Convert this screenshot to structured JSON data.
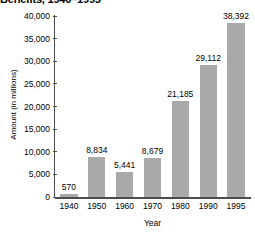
{
  "chart_data": {
    "type": "bar",
    "title": "Benefits, 1940–1995",
    "xlabel": "Year",
    "ylabel": "Amount (in millions)",
    "categories": [
      "1940",
      "1950",
      "1960",
      "1970",
      "1980",
      "1990",
      "1995"
    ],
    "values": [
      570,
      8834,
      5441,
      8679,
      21185,
      29112,
      38392
    ],
    "value_labels": [
      "570",
      "8,834",
      "5,441",
      "8,679",
      "21,185",
      "29,112",
      "38,392"
    ],
    "ylim": [
      0,
      40000
    ],
    "ytick_values": [
      0,
      5000,
      10000,
      15000,
      20000,
      25000,
      30000,
      35000,
      40000
    ],
    "ytick_labels": [
      "0",
      "5,000",
      "10,000",
      "15,000",
      "20,000",
      "25,000",
      "30,000",
      "35,000",
      "40,000"
    ],
    "grid": false,
    "legend": null,
    "bar_color": "#a9a9a9",
    "axis_color": "#4d4d4d",
    "text_color": "#000000",
    "background": "#ffffff"
  }
}
